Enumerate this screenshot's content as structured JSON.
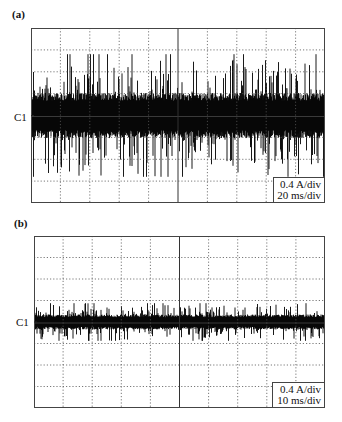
{
  "figure": {
    "panels": [
      {
        "label": "(a)",
        "channel_marker": "C1",
        "legend": {
          "line1": "0.4 A/div",
          "line2": "20 ms/div"
        }
      },
      {
        "label": "(b)",
        "channel_marker": "C1",
        "legend": {
          "line1": "0.4 A/div",
          "line2": "10 ms/div"
        }
      }
    ]
  },
  "chart_data": [
    {
      "type": "line",
      "title": "(a)",
      "xlabel": "time (10 div × 20 ms/div)",
      "ylabel": "current (8 div × 0.4 A/div)",
      "channel": "C1",
      "x_divisions": 10,
      "y_divisions": 8,
      "x_scale": "20 ms/div",
      "y_scale": "0.4 A/div",
      "xlim_ms": [
        0,
        200
      ],
      "ylim_A": [
        -1.6,
        1.6
      ],
      "grid": "dotted, solid center cross",
      "legend_position": "bottom-right",
      "signal": {
        "description": "broadband noisy current ripple centered at C1",
        "core_amplitude_A": 0.36,
        "peak_amplitude_A": 1.12,
        "color": "#000000"
      }
    },
    {
      "type": "line",
      "title": "(b)",
      "xlabel": "time (10 div × 10 ms/div)",
      "ylabel": "current (8 div × 0.4 A/div)",
      "channel": "C1",
      "x_divisions": 10,
      "y_divisions": 8,
      "x_scale": "10 ms/div",
      "y_scale": "0.4 A/div",
      "xlim_ms": [
        0,
        100
      ],
      "ylim_A": [
        -1.6,
        1.6
      ],
      "grid": "dotted, solid center cross",
      "legend_position": "bottom-right",
      "signal": {
        "description": "low-amplitude noisy current ripple centered at C1",
        "core_amplitude_A": 0.12,
        "peak_amplitude_A": 0.35,
        "color": "#000000"
      }
    }
  ]
}
